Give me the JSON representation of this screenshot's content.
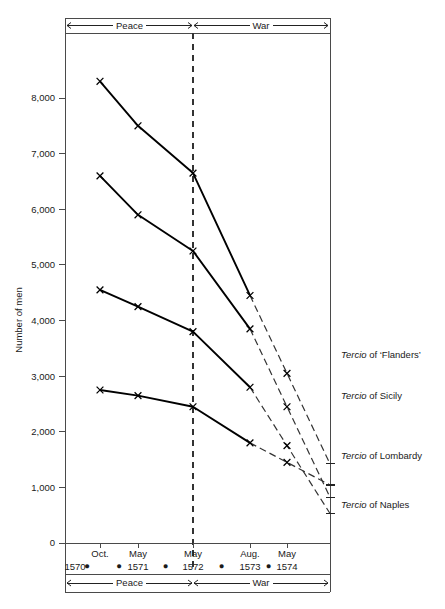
{
  "chart_data": {
    "type": "line",
    "title": "",
    "xlabel": "",
    "ylabel": "Number of men",
    "ylim": [
      0,
      8500
    ],
    "yticks": [
      0,
      1000,
      2000,
      3000,
      4000,
      5000,
      6000,
      7000,
      8000
    ],
    "ytick_labels": [
      "0",
      "1,000",
      "2,000",
      "3,000",
      "4,000",
      "5,000",
      "6,000",
      "7,000",
      "8,000"
    ],
    "grid": false,
    "legend_position": "right",
    "categories": [
      "Oct. 1570",
      "May 1571",
      "May 1572",
      "Aug. 1573",
      "May 1574"
    ],
    "x_months": [
      "Oct.",
      "May",
      "May",
      "Aug.",
      "May"
    ],
    "x_years": [
      "1570",
      "1571",
      "1572",
      "1573",
      "1574"
    ],
    "period_bands": [
      {
        "label": "Peace",
        "from": "Oct. 1570",
        "to": "May 1572"
      },
      {
        "label": "War",
        "from": "May 1572",
        "to": "May 1574"
      }
    ],
    "series": [
      {
        "name": "Tercio of 'Flanders'",
        "values": [
          8300,
          7500,
          6650,
          4450,
          3050
        ],
        "dashed_from_index": 3
      },
      {
        "name": "Tercio of Sicily",
        "values": [
          6600,
          5900,
          5250,
          3850,
          2450
        ],
        "dashed_from_index": 3
      },
      {
        "name": "Tercio of Lombardy",
        "values": [
          4550,
          4250,
          3800,
          2800,
          1750
        ],
        "dashed_from_index": 3
      },
      {
        "name": "Tercio of Naples",
        "values": [
          2750,
          2650,
          2450,
          1800,
          1450
        ],
        "dashed_from_index": 3
      }
    ],
    "marker": "x",
    "annotations": [
      {
        "text": "Tercio of 'Flanders'",
        "value": 3050
      },
      {
        "text": "Tercio of Sicily",
        "value": 2450
      },
      {
        "text": "Tercio of Lombardy",
        "value": 1750
      },
      {
        "text": "Tercio of Naples",
        "value": 1450
      }
    ],
    "divider": {
      "at": "May 1572",
      "style": "dashed",
      "note": "Peace/War boundary"
    }
  },
  "legend": {
    "items": [
      {
        "italic": "Tercio",
        "rest": " of ‘Flanders’"
      },
      {
        "italic": "Tercio",
        "rest": " of Sicily"
      },
      {
        "italic": "Tercio",
        "rest": " of Lombardy"
      },
      {
        "italic": "Tercio",
        "rest": " of Naples"
      }
    ]
  },
  "labels": {
    "y_axis_title": "Number of men",
    "band_top_left": "Peace",
    "band_top_right": "War",
    "band_bottom_left": "Peace",
    "band_bottom_right": "War",
    "y0": "0",
    "y1": "1,000",
    "y2": "2,000",
    "y3": "3,000",
    "y4": "4,000",
    "y5": "5,000",
    "y6": "6,000",
    "y7": "7,000",
    "y8": "8,000",
    "m0": "Oct.",
    "m1": "May",
    "m2": "May",
    "m3": "Aug.",
    "m4": "May",
    "yr0": "1570",
    "yr1": "1571",
    "yr2": "1572",
    "yr3": "1573",
    "yr4": "1574",
    "dot": "●"
  },
  "colors": {
    "line": "#000000",
    "axis": "#4a4a4a",
    "frame": "#4a4a4a",
    "text": "#1a1a1a",
    "background": "#ffffff"
  }
}
